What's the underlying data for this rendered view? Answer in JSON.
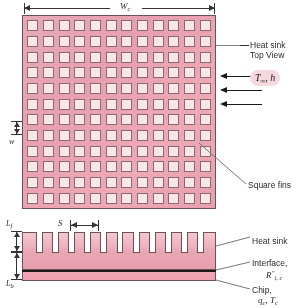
{
  "figure": {
    "colors": {
      "fin_base": "#e9a2b1",
      "fin_top": "#f7e7e9",
      "outline": "#6f5056",
      "interface_line": "#1b1b1b",
      "badge_bg": "#f7d8df",
      "leader": "#555555"
    }
  },
  "dimensions": {
    "width_label": "W",
    "width_sub": "c",
    "fin_width_label": "w",
    "spacing_label": "S",
    "fin_length_label": "L",
    "fin_length_sub": "f",
    "base_length_label": "L",
    "base_length_sub": "b"
  },
  "flow": {
    "badge_symbol": "T",
    "badge_sub": "∞",
    "badge_sep": ", ",
    "badge_h": "h",
    "arrow_count": 3
  },
  "callouts": {
    "heat_sink_top_view_line1": "Heat sink",
    "heat_sink_top_view_line2": "Top View",
    "square_fins": "Square fins",
    "heat_sink": "Heat sink",
    "interface": "Interface,",
    "interface_symbol": "R",
    "interface_sup": "″",
    "interface_sub": "t, c",
    "chip": "Chip,",
    "chip_symbol_q": "q",
    "chip_sub_q": "c",
    "chip_sep": ", ",
    "chip_symbol_t": "T",
    "chip_sub_t": "c"
  },
  "grid": {
    "columns": 12,
    "rows": 12,
    "side_fin_count": 12
  }
}
